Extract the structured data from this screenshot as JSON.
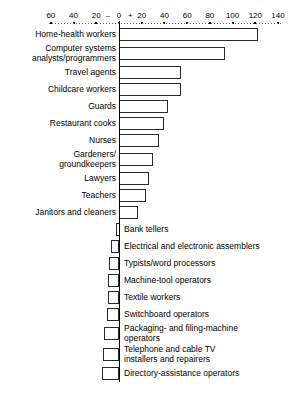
{
  "chart_data": {
    "type": "bar",
    "orientation": "horizontal",
    "title": "",
    "xlabel": "",
    "ylabel": "",
    "xlim": [
      -70,
      145
    ],
    "grid": false,
    "legend": null,
    "axis": {
      "tick_labels": [
        "60",
        "40",
        "20",
        "–",
        "0",
        "+",
        "20",
        "40",
        "60",
        "80",
        "100",
        "120",
        "140"
      ],
      "tick_values": [
        -60,
        -40,
        -20,
        -10,
        0,
        10,
        20,
        40,
        60,
        80,
        100,
        120,
        140
      ],
      "negative_sign": "–",
      "positive_sign": "+",
      "zero_value": 0
    },
    "categories": [
      "Home-health workers",
      "Computer systems\nanalysts/programmers",
      "Travel agents",
      "Childcare workers",
      "Guards",
      "Restaurant cooks",
      "Nurses",
      "Gardeners/\ngroundkeepers",
      "Lawyers",
      "Teachers",
      "Janitors and cleaners",
      "Bank tellers",
      "Electrical and electronic assemblers",
      "Typists/word processors",
      "Machine-tool operators",
      "Textile workers",
      "Switchboard operators",
      "Packaging- and filing-machine\noperators",
      "Telephone and cable TV\ninstallers and repairers",
      "Directory-assistance operators"
    ],
    "values": [
      122,
      93,
      55,
      55,
      43,
      40,
      35,
      30,
      26,
      24,
      17,
      -3,
      -7,
      -9,
      -10,
      -10,
      -11,
      -13,
      -14,
      -15
    ]
  }
}
